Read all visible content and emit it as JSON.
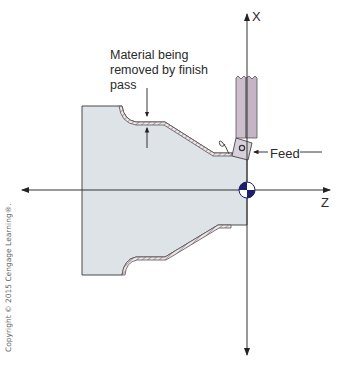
{
  "diagram": {
    "labels": {
      "callout": "Material being removed by finish pass",
      "feed": "Feed",
      "axis_x": "X",
      "axis_z": "Z",
      "copyright": "Copyright © 2015 Cengage Learning®."
    },
    "elements": [
      "workpiece",
      "finish-pass-material-hatched",
      "tool-holder",
      "cutting-insert",
      "chip",
      "feed-arrow",
      "x-axis",
      "z-axis",
      "origin-marker",
      "material-thickness-arrows"
    ],
    "colors": {
      "workpiece_fill": "#dde3e6",
      "outline": "#4a4a4a",
      "hatch": "#b69aa5",
      "tool_holder": "#cbbccb",
      "insert": "#d9d2dc",
      "origin_dark": "#1c1f6b",
      "axis": "#333333"
    }
  }
}
